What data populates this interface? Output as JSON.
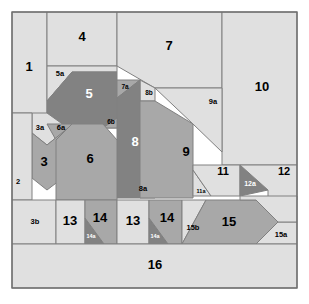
{
  "figure": {
    "canvas": {
      "width": 309,
      "height": 304
    },
    "frame": {
      "x": 12,
      "y": 12,
      "width": 285,
      "height": 276
    },
    "background_color": "#ffffff",
    "stroke_color": "#808080"
  },
  "palette": {
    "light": "#e0e0e0",
    "light_alt": "#dcdcdc",
    "medium": "#a8a8a8",
    "dark": "#828282",
    "label_dark": "#000000",
    "label_light": "#ffffff"
  },
  "chart_data": {
    "type": "diagram",
    "xlabel": "",
    "ylabel": "",
    "pieces": [
      {
        "id": "1",
        "label": "1",
        "tone": "light",
        "text_tone": "dark",
        "font_size": 13,
        "label_x": 29,
        "label_y": 68,
        "points": "12,12 47,12 47,124 32,124 32,113 12,113"
      },
      {
        "id": "4",
        "label": "4",
        "tone": "light",
        "text_tone": "dark",
        "font_size": 13,
        "label_x": 82,
        "label_y": 38,
        "points": "47,12 117,12 117,66 47,66"
      },
      {
        "id": "7",
        "label": "7",
        "tone": "light",
        "text_tone": "dark",
        "font_size": 13,
        "label_x": 169,
        "label_y": 47,
        "points": "117,12 222,12 222,88 155,88 117,66"
      },
      {
        "id": "10",
        "label": "10",
        "tone": "light",
        "text_tone": "dark",
        "font_size": 13,
        "label_x": 262,
        "label_y": 88,
        "points": "222,12 297,12 297,165 222,165"
      },
      {
        "id": "5a",
        "label": "5a",
        "tone": "light",
        "text_tone": "dark",
        "font_size": 7.5,
        "label_x": 60,
        "label_y": 74,
        "points": "47,66 117,66 117,72 72,72 47,101"
      },
      {
        "id": "5",
        "label": "5",
        "tone": "dark",
        "text_tone": "light",
        "font_size": 13,
        "label_x": 89,
        "label_y": 95,
        "points": "72,72 117,72 117,128 68,128 47,115 47,101"
      },
      {
        "id": "7a",
        "label": "7a",
        "tone": "medium",
        "text_tone": "dark",
        "font_size": 6.5,
        "label_x": 125,
        "label_y": 87,
        "points": "117,80 140,80 117,98"
      },
      {
        "id": "8b",
        "label": "8b",
        "tone": "light",
        "text_tone": "dark",
        "font_size": 6.5,
        "label_x": 149,
        "label_y": 93,
        "points": "140,80 155,88 155,101 140,101"
      },
      {
        "id": "9a",
        "label": "9a",
        "tone": "light",
        "text_tone": "dark",
        "font_size": 7.5,
        "label_x": 213,
        "label_y": 102,
        "points": "155,88 222,88 222,152 193,124"
      },
      {
        "id": "8",
        "label": "8",
        "tone": "dark",
        "text_tone": "light",
        "font_size": 13,
        "label_x": 135,
        "label_y": 143,
        "points": "117,98 140,80 140,198 117,198"
      },
      {
        "id": "8a",
        "label": "8a",
        "tone": "medium",
        "text_tone": "dark",
        "font_size": 7.5,
        "label_x": 143,
        "label_y": 189,
        "points": "140,160 155,198 140,198"
      },
      {
        "id": "9",
        "label": "9",
        "tone": "medium",
        "text_tone": "dark",
        "font_size": 13,
        "label_x": 186,
        "label_y": 153,
        "points": "155,101 193,124 193,198 140,198 140,101"
      },
      {
        "id": "6b",
        "label": "6b",
        "tone": "medium",
        "text_tone": "dark",
        "font_size": 6.5,
        "label_x": 111,
        "label_y": 122,
        "points": "103,128 117,128 117,118"
      },
      {
        "id": "3a",
        "label": "3a",
        "tone": "light",
        "text_tone": "dark",
        "font_size": 7.5,
        "label_x": 40,
        "label_y": 128,
        "points": "32,113 47,113 68,128 47,145 32,133"
      },
      {
        "id": "6a",
        "label": "6a",
        "tone": "medium",
        "text_tone": "dark",
        "font_size": 7.5,
        "label_x": 61,
        "label_y": 128,
        "points": "47,124 72,124 56,140"
      },
      {
        "id": "3",
        "label": "3",
        "tone": "medium",
        "text_tone": "dark",
        "font_size": 13,
        "label_x": 44,
        "label_y": 163,
        "points": "32,133 47,145 68,128 68,174 47,190 32,178"
      },
      {
        "id": "6",
        "label": "6",
        "tone": "medium",
        "text_tone": "dark",
        "font_size": 13,
        "label_x": 90,
        "label_y": 160,
        "points": "56,140 72,124 103,124 117,140 117,200 56,200"
      },
      {
        "id": "2",
        "label": "2",
        "tone": "light",
        "text_tone": "dark",
        "font_size": 7.5,
        "label_x": 18,
        "label_y": 182,
        "points": "12,113 32,113 32,200 12,200"
      },
      {
        "id": "3b",
        "label": "3b",
        "tone": "light",
        "text_tone": "dark",
        "font_size": 7.5,
        "label_x": 35,
        "label_y": 222,
        "points": "12,200 56,200 56,244 12,244"
      },
      {
        "id": "13L",
        "label": "13",
        "tone": "light",
        "text_tone": "dark",
        "font_size": 13,
        "label_x": 70,
        "label_y": 222,
        "points": "56,200 85,200 85,244 56,244"
      },
      {
        "id": "14a_L",
        "label": "14a",
        "tone": "dark",
        "text_tone": "light",
        "font_size": 5.5,
        "label_x": 91,
        "label_y": 237,
        "points": "85,218 104,244 85,244"
      },
      {
        "id": "14L",
        "label": "14",
        "tone": "medium",
        "text_tone": "dark",
        "font_size": 13,
        "label_x": 100,
        "label_y": 219,
        "points": "85,200 117,200 117,244 104,244 85,218"
      },
      {
        "id": "13R",
        "label": "13",
        "tone": "light",
        "text_tone": "dark",
        "font_size": 13,
        "label_x": 133,
        "label_y": 222,
        "points": "117,200 149,200 149,244 117,244"
      },
      {
        "id": "14a_R",
        "label": "14a",
        "tone": "dark",
        "text_tone": "light",
        "font_size": 5.5,
        "label_x": 155,
        "label_y": 237,
        "points": "149,218 168,244 149,244"
      },
      {
        "id": "14R",
        "label": "14",
        "tone": "medium",
        "text_tone": "dark",
        "font_size": 13,
        "label_x": 167,
        "label_y": 219,
        "points": "149,200 182,200 182,244 168,244 149,218"
      },
      {
        "id": "15b",
        "label": "15b",
        "tone": "light",
        "text_tone": "dark",
        "font_size": 7.5,
        "label_x": 193,
        "label_y": 228,
        "points": "182,200 206,200 182,244"
      },
      {
        "id": "15",
        "label": "15",
        "tone": "medium",
        "text_tone": "dark",
        "font_size": 13,
        "label_x": 229,
        "label_y": 223,
        "points": "206,200 256,200 278,222 256,244 182,244"
      },
      {
        "id": "15a",
        "label": "15a",
        "tone": "light",
        "text_tone": "dark",
        "font_size": 7.5,
        "label_x": 281,
        "label_y": 235,
        "points": "278,222 297,222 297,244 256,244"
      },
      {
        "id": "11a",
        "label": "11a",
        "tone": "light",
        "text_tone": "dark",
        "font_size": 5.5,
        "label_x": 201,
        "label_y": 192,
        "points": "193,170 211,196 193,196"
      },
      {
        "id": "11",
        "label": "11",
        "tone": "light",
        "text_tone": "dark",
        "font_size": 11,
        "label_x": 223,
        "label_y": 172,
        "points": "193,165 240,165 240,196 211,196 193,170"
      },
      {
        "id": "12a",
        "label": "12a",
        "tone": "dark",
        "text_tone": "light",
        "font_size": 7,
        "label_x": 250,
        "label_y": 184,
        "points": "240,165 268,190 240,196"
      },
      {
        "id": "12",
        "label": "12",
        "tone": "light",
        "text_tone": "dark",
        "font_size": 11,
        "label_x": 284,
        "label_y": 172,
        "points": "240,165 297,165 297,200 268,200 268,190"
      },
      {
        "id": "12b",
        "label": "",
        "tone": "light",
        "text_tone": "dark",
        "font_size": 7,
        "label_x": 278,
        "label_y": 207,
        "points": "240,196 297,196 297,222 278,222 256,200 240,200"
      },
      {
        "id": "16",
        "label": "16",
        "tone": "light",
        "text_tone": "dark",
        "font_size": 13,
        "label_x": 155,
        "label_y": 266,
        "points": "12,244 297,244 297,288 12,288"
      }
    ]
  }
}
